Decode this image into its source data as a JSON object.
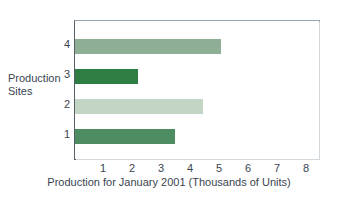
{
  "chart_data": {
    "type": "bar",
    "orientation": "horizontal",
    "title": "",
    "xlabel": "Production for January 2001 (Thousands of Units)",
    "ylabel": "Production\nSites",
    "categories": [
      "1",
      "2",
      "3",
      "4"
    ],
    "values": [
      3.45,
      4.4,
      2.15,
      5.0
    ],
    "xlim": [
      0,
      8.5
    ],
    "xticks": [
      "1",
      "2",
      "3",
      "4",
      "5",
      "6",
      "7",
      "8"
    ],
    "xtick_values": [
      1,
      2,
      3,
      4,
      5,
      6,
      7,
      8
    ],
    "yticks": [
      "1",
      "2",
      "3",
      "4"
    ],
    "grid": false,
    "legend": false,
    "bar_colors": [
      "#4e8c62",
      "#c3d6c6",
      "#2e7d43",
      "#8eae96"
    ],
    "series": [
      {
        "name": "Production",
        "points": [
          {
            "category": "1",
            "value": 3.45,
            "color": "#4e8c62"
          },
          {
            "category": "2",
            "value": 4.4,
            "color": "#c3d6c6"
          },
          {
            "category": "3",
            "value": 2.15,
            "color": "#2e7d43"
          },
          {
            "category": "4",
            "value": 5.0,
            "color": "#8eae96"
          }
        ]
      }
    ]
  },
  "axes": {
    "y_title": "Production\nSites",
    "x_title": "Production for January 2001 (Thousands of Units)",
    "y_tick_4": "4",
    "y_tick_3": "3",
    "y_tick_2": "2",
    "y_tick_1": "1",
    "x_tick_1": "1",
    "x_tick_2": "2",
    "x_tick_3": "3",
    "x_tick_4": "4",
    "x_tick_5": "5",
    "x_tick_6": "6",
    "x_tick_7": "7",
    "x_tick_8": "8"
  },
  "colors": {
    "text": "#3a4550",
    "frame": "#9aa4ae",
    "axis": "#555f69",
    "background": "#ffffff"
  }
}
